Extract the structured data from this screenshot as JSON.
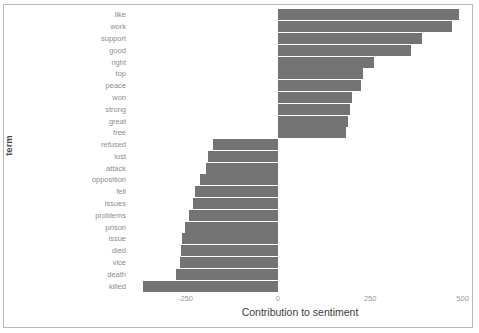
{
  "chart_data": {
    "type": "bar",
    "orientation": "horizontal",
    "title": "",
    "xlabel": "Contribution to sentiment",
    "ylabel": "term",
    "xlim": [
      -400,
      520
    ],
    "xticks": [
      -250,
      0,
      250,
      500
    ],
    "xtick_labels": [
      "-250",
      "0",
      "250",
      "500"
    ],
    "grid": false,
    "legend": null,
    "bar_color": "#737373",
    "panel_background": "#ffffff",
    "categories": [
      "like",
      "work",
      "support",
      "good",
      "right",
      "top",
      "peace",
      "won",
      "strong",
      "great",
      "free",
      "refused",
      "lost",
      "attack",
      "opposition",
      "fell",
      "issues",
      "problems",
      "prison",
      "issue",
      "died",
      "vice",
      "death",
      "killed"
    ],
    "values": [
      490,
      470,
      390,
      360,
      260,
      230,
      225,
      200,
      195,
      190,
      185,
      -175,
      -190,
      -195,
      -210,
      -225,
      -230,
      -240,
      -250,
      -260,
      -262,
      -265,
      -275,
      -365
    ]
  }
}
